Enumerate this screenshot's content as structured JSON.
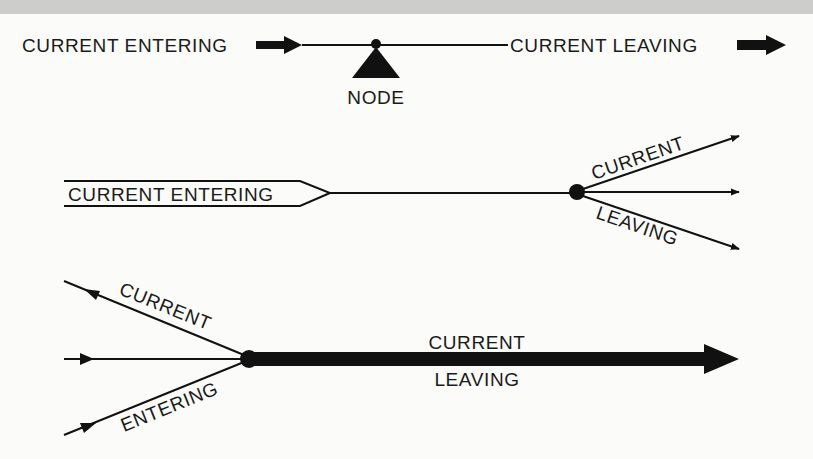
{
  "colors": {
    "ink": "#111111",
    "paper": "#fbfbf9",
    "top_band": "#cdcdcb"
  },
  "row1": {
    "entering_label": "CURRENT ENTERING",
    "leaving_label": "CURRENT LEAVING",
    "node_label": "NODE"
  },
  "row2": {
    "entering_label": "CURRENT ENTERING",
    "leaving_label_top": "CURRENT",
    "leaving_label_bottom": "LEAVING"
  },
  "row3": {
    "entering_label_top": "CURRENT",
    "entering_label_bottom": "ENTERING",
    "leaving_label_top": "CURRENT",
    "leaving_label_bottom": "LEAVING"
  }
}
